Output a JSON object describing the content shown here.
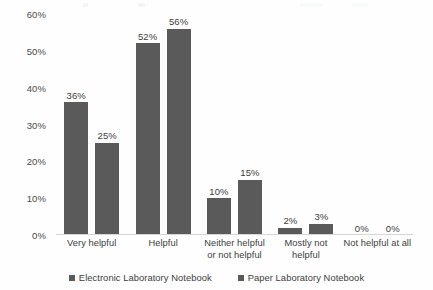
{
  "chart_data": {
    "type": "bar",
    "title": "",
    "subtitle": "",
    "xlabel": "",
    "ylabel": "",
    "ylim": [
      0,
      60
    ],
    "ytick_labels": [
      "60%",
      "50%",
      "40%",
      "30%",
      "20%",
      "10%",
      "0%"
    ],
    "ytick_values": [
      60,
      50,
      40,
      30,
      20,
      10,
      0
    ],
    "grid": false,
    "legend_position": "bottom",
    "categories": [
      "Very helpful",
      "Helpful",
      "Neither helpful or not helpful",
      "Mostly not helpful",
      "Not helpful at all"
    ],
    "series": [
      {
        "name": "Electronic Laboratory Notebook",
        "color": "#5a5a5a",
        "values": [
          36,
          52,
          10,
          2,
          0
        ],
        "labels": [
          "36%",
          "52%",
          "10%",
          "2%",
          "0%"
        ]
      },
      {
        "name": "Paper Laboratory Notebook",
        "color": "#5a5a5a",
        "values": [
          25,
          56,
          15,
          3,
          0
        ],
        "labels": [
          "25%",
          "56%",
          "15%",
          "3%",
          "0%"
        ]
      }
    ]
  },
  "legend": {
    "items": [
      {
        "label": "Electronic Laboratory Notebook",
        "color": "#5a5a5a"
      },
      {
        "label": "Paper Laboratory Notebook",
        "color": "#5a5a5a"
      }
    ]
  },
  "colors": {
    "bar": "#5a5a5a",
    "axis_line": "#d6d6d6",
    "text": "#3d3d3d",
    "background": "#fefefe"
  }
}
